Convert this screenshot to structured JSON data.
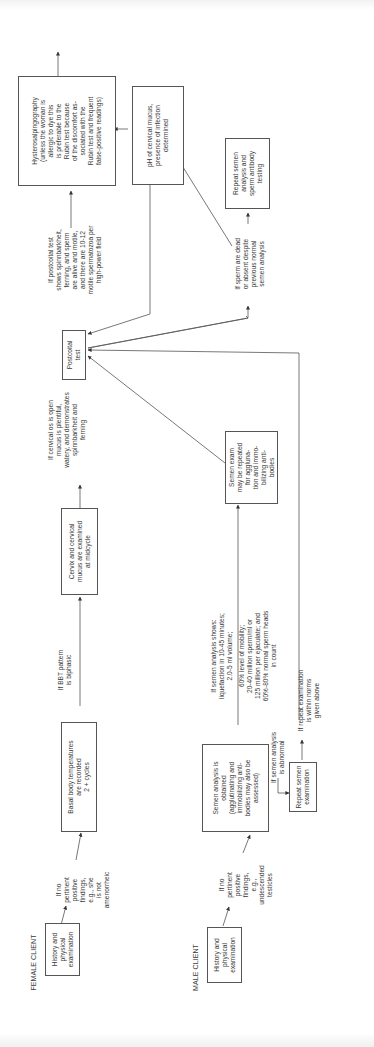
{
  "diagram": {
    "female": {
      "heading": "FEMALE CLIENT",
      "history_box": [
        "History and",
        "physical",
        "examination"
      ],
      "cond1": [
        "If no",
        "pertinent",
        "positive",
        "findings,",
        "e.g., she",
        "is not",
        "amenorrheic"
      ],
      "bbt_box": [
        "Basal body temperatures",
        "are recorded",
        "2 + cycles"
      ],
      "cond2": [
        "If BBT pattern",
        "is biphasic"
      ],
      "cervix_box": [
        "Cervix and cervical",
        "mucus are examined",
        "at midcycle"
      ],
      "cond3": [
        "If cervical os is open",
        "mucus is plentiful,",
        "watery, and demonstrates",
        "spinnbarkheit and",
        "ferning"
      ],
      "postcoital_box": [
        "Postcoital",
        "test"
      ],
      "cond4": [
        "If postcoital test",
        "shows spinnbarkheit,",
        "ferning, and sperm",
        "are alive and motile,",
        "and there are 10-12",
        "motile spermatozoa per",
        "high-power field"
      ],
      "hsg_box": [
        "Hysterosalpingography",
        "(unless the woman is",
        "allergic to dye this",
        "is preferable to the",
        "Rubin test because",
        "of the discomfort as-",
        "sociated with the",
        "Rubin test and frequent",
        "false-positive readings)"
      ],
      "ph_box": [
        "pH of cervical mucus,",
        "presence of infection",
        "determined"
      ]
    },
    "male": {
      "heading": "MALE CLIENT",
      "history_box": [
        "History and",
        "physical",
        "examination"
      ],
      "cond1": [
        "If no",
        "pertinent",
        "positive",
        "findings,",
        "e.g.,",
        "undescended",
        "testicles"
      ],
      "semen_box": [
        "Semen analysis is",
        "obtained",
        "(agglutinating and",
        "immobilizing anti-",
        "bodies may also be",
        "assessed)"
      ],
      "cond_abnormal": [
        "If semen analysis",
        "is abnormal"
      ],
      "repeat_box": [
        "Repeat semen",
        "examination"
      ],
      "cond_repeat_ok": [
        "If repeat examination",
        "is within norms",
        "given above"
      ],
      "cond_normal_a": [
        "If semen analysis shows:",
        "liquefaction in 10-45 minutes;",
        "2.0-5 ml volume;"
      ],
      "cond_normal_b": [
        "60% level of mobility;",
        "20-40 million sperm/ml or",
        "125 million per ejaculate; and",
        "60%-80% normal sperm heads",
        "in count"
      ],
      "semen_exam_box": [
        "Semen exam",
        "may be repeated",
        "for aggluna-",
        "tion and immo-",
        "bilizing anti-",
        "bodies"
      ],
      "cond_dead": [
        "If sperm are dead",
        "or absent despite",
        "previous normal",
        "semen analysis"
      ],
      "antibody_box": [
        "Repeat semen",
        "analysis and",
        "sperm antibody",
        "testing"
      ]
    },
    "colors": {
      "line": "#444444",
      "text": "#3a3a3a",
      "border": "#555555",
      "background": "#ffffff"
    }
  }
}
